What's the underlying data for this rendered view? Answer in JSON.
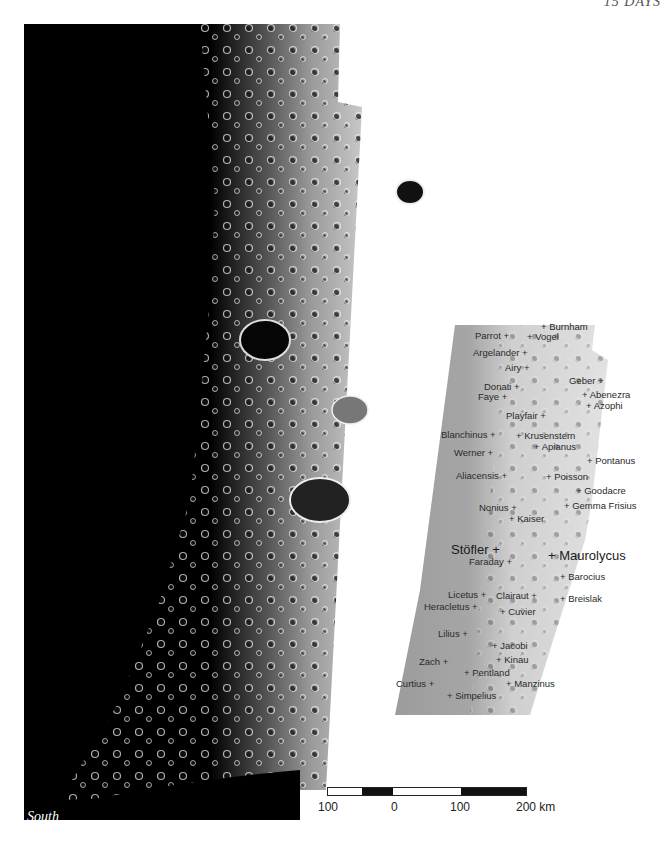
{
  "page": {
    "header": "15 DAYS",
    "orientation_label": "South"
  },
  "map": {
    "colors": {
      "space": "#000000",
      "highlands": "#b8b8b8",
      "panel_plains": "#a0a0a0",
      "panel_lit": "#d4d4d4",
      "background": "#ffffff"
    },
    "labels": [
      {
        "name": "Burnham",
        "x": 541,
        "y": 327,
        "plus": "left"
      },
      {
        "name": "Parrot",
        "x": 475,
        "y": 336,
        "plus": "right"
      },
      {
        "name": "Vogel",
        "x": 527,
        "y": 337,
        "plus": "left"
      },
      {
        "name": "Argelander",
        "x": 473,
        "y": 353,
        "plus": "right"
      },
      {
        "name": "Airy",
        "x": 505,
        "y": 368,
        "plus": "right"
      },
      {
        "name": "Geber",
        "x": 569,
        "y": 381,
        "plus": "right"
      },
      {
        "name": "Donati",
        "x": 484,
        "y": 387,
        "plus": "right"
      },
      {
        "name": "Abenezra",
        "x": 582,
        "y": 395,
        "plus": "left"
      },
      {
        "name": "Faye",
        "x": 478,
        "y": 397,
        "plus": "right"
      },
      {
        "name": "Azophi",
        "x": 586,
        "y": 406,
        "plus": "left"
      },
      {
        "name": "Playfair",
        "x": 506,
        "y": 416,
        "plus": "right"
      },
      {
        "name": "Blanchinus",
        "x": 441,
        "y": 435,
        "plus": "right"
      },
      {
        "name": "Krusenstern",
        "x": 516,
        "y": 436,
        "plus": "left"
      },
      {
        "name": "Apianus",
        "x": 534,
        "y": 447,
        "plus": "left"
      },
      {
        "name": "Werner",
        "x": 454,
        "y": 453,
        "plus": "right"
      },
      {
        "name": "Pontanus",
        "x": 587,
        "y": 461,
        "plus": "left"
      },
      {
        "name": "Aliacensis",
        "x": 456,
        "y": 476,
        "plus": "right"
      },
      {
        "name": "Poisson",
        "x": 546,
        "y": 477,
        "plus": "left"
      },
      {
        "name": "Goodacre",
        "x": 576,
        "y": 491,
        "plus": "left"
      },
      {
        "name": "Nonius",
        "x": 479,
        "y": 508,
        "plus": "right"
      },
      {
        "name": "Gemma Frisius",
        "x": 564,
        "y": 506,
        "plus": "left"
      },
      {
        "name": "Kaiser",
        "x": 509,
        "y": 519,
        "plus": "left"
      },
      {
        "name": "Stöfler",
        "x": 451,
        "y": 550,
        "plus": "right",
        "big": true
      },
      {
        "name": "Maurolycus",
        "x": 548,
        "y": 556,
        "plus": "left",
        "big": true
      },
      {
        "name": "Faraday",
        "x": 469,
        "y": 562,
        "plus": "right"
      },
      {
        "name": "Barocius",
        "x": 560,
        "y": 577,
        "plus": "left"
      },
      {
        "name": "Licetus",
        "x": 448,
        "y": 595,
        "plus": "right"
      },
      {
        "name": "Clairaut",
        "x": 496,
        "y": 596,
        "plus": "right"
      },
      {
        "name": "Breislak",
        "x": 560,
        "y": 599,
        "plus": "left"
      },
      {
        "name": "Heracletus",
        "x": 424,
        "y": 607,
        "plus": "right"
      },
      {
        "name": "Cuvier",
        "x": 500,
        "y": 612,
        "plus": "left"
      },
      {
        "name": "Lilius",
        "x": 438,
        "y": 634,
        "plus": "right"
      },
      {
        "name": "Jacobi",
        "x": 492,
        "y": 646,
        "plus": "left"
      },
      {
        "name": "Zach",
        "x": 419,
        "y": 662,
        "plus": "right"
      },
      {
        "name": "Kinau",
        "x": 496,
        "y": 660,
        "plus": "left"
      },
      {
        "name": "Pentland",
        "x": 464,
        "y": 673,
        "plus": "left"
      },
      {
        "name": "Curtius",
        "x": 396,
        "y": 684,
        "plus": "right"
      },
      {
        "name": "Manzinus",
        "x": 506,
        "y": 684,
        "plus": "left"
      },
      {
        "name": "Simpelius",
        "x": 447,
        "y": 696,
        "plus": "left"
      }
    ]
  },
  "scalebar": {
    "ticks": [
      "100",
      "0",
      "100",
      "200 km"
    ],
    "segments": [
      "#ffffff",
      "#111111",
      "#ffffff",
      "#111111"
    ]
  }
}
